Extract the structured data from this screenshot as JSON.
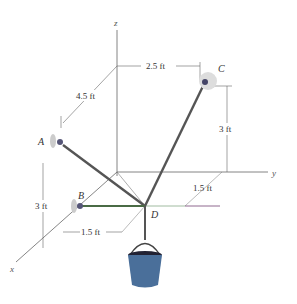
{
  "figure": {
    "axes": {
      "x": "x",
      "y": "y",
      "z": "z"
    },
    "points": {
      "A": "A",
      "B": "B",
      "C": "C",
      "D": "D"
    },
    "dimensions": {
      "a_along_x": "4.5 ft",
      "c_along_y": "2.5 ft",
      "c_height": "3 ft",
      "b_height": "3 ft",
      "b_to_d": "1.5 ft",
      "d_offset_y": "1.5 ft"
    }
  }
}
